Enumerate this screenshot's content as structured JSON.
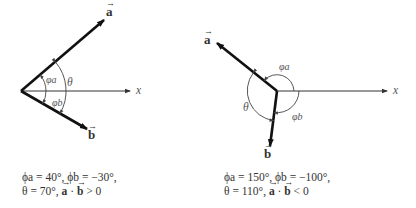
{
  "figures": [
    {
      "id": "left",
      "axis_label": "x",
      "vector_a_label": "a",
      "vector_b_label": "b",
      "angle_labels": {
        "phi_a": "φa",
        "phi_b": "φb",
        "theta": "θ"
      },
      "caption_line1": "ϕa = 40°, ϕb = −30°,",
      "caption_line2_prefix": "θ = 70°,",
      "caption_line2_a": "a",
      "caption_line2_dot": "·",
      "caption_line2_b": "b",
      "caption_line2_suffix": "> 0"
    },
    {
      "id": "right",
      "axis_label": "x",
      "vector_a_label": "a",
      "vector_b_label": "b",
      "angle_labels": {
        "phi_a": "φa",
        "phi_b": "φb",
        "theta": "θ"
      },
      "caption_line1": "ϕa = 150°, ϕb = −100°,",
      "caption_line2_prefix": "θ = 110°,",
      "caption_line2_a": "a",
      "caption_line2_dot": "·",
      "caption_line2_b": "b",
      "caption_line2_suffix": "< 0"
    }
  ],
  "colors": {
    "vector": "#111111",
    "axis": "#333333",
    "arc": "#444444",
    "label": "#555555"
  }
}
